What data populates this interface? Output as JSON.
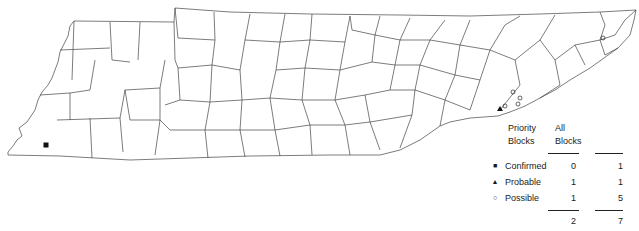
{
  "map": {
    "region": "Tennessee counties",
    "markers": [
      {
        "type": "confirmed",
        "symbol": "square-filled",
        "x": 46,
        "y": 145
      },
      {
        "type": "probable",
        "symbol": "triangle-filled",
        "x": 500,
        "y": 109
      },
      {
        "type": "possible",
        "symbol": "circle-open",
        "x": 603,
        "y": 38
      },
      {
        "type": "possible",
        "symbol": "circle-open",
        "x": 513,
        "y": 92
      },
      {
        "type": "possible",
        "symbol": "circle-open",
        "x": 520,
        "y": 98
      },
      {
        "type": "possible",
        "symbol": "circle-open",
        "x": 518,
        "y": 104
      },
      {
        "type": "possible",
        "symbol": "circle-open",
        "x": 505,
        "y": 106
      }
    ]
  },
  "legend": {
    "columns": [
      {
        "line1": "Priority",
        "line2": "Blocks"
      },
      {
        "line1": "All",
        "line2": "Blocks"
      }
    ],
    "rows": [
      {
        "symbol": "■",
        "icon": "square-filled-icon",
        "label": "Confirmed",
        "priority": "0",
        "all": "1"
      },
      {
        "symbol": "▲",
        "icon": "triangle-filled-icon",
        "label": "Probable",
        "priority": "1",
        "all": "1"
      },
      {
        "symbol": "○",
        "icon": "circle-open-icon",
        "label": "Possible",
        "priority": "1",
        "all": "5"
      }
    ],
    "totals": {
      "priority": "2",
      "all": "7"
    }
  }
}
